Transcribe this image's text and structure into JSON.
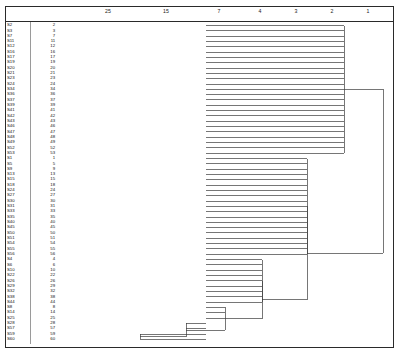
{
  "chart_data": {
    "type": "dendrogram",
    "title": "",
    "subtitle": "",
    "xlabel": "Rescaled Distance Cluster Combine",
    "ylabel": "",
    "grid": false,
    "legend": null,
    "axis": {
      "orientation": "top",
      "direction": "decreasing-left-to-right",
      "tick_labels": [
        "25",
        "15",
        "7",
        "4",
        "3",
        "2",
        "1"
      ],
      "tick_positions_px": [
        108,
        166,
        219,
        260,
        296,
        332,
        368
      ],
      "range": [
        25,
        1
      ]
    },
    "leaf_count": 60,
    "leaf_labels_left": [
      "S2",
      "S3",
      "S7",
      "S11",
      "S12",
      "S16",
      "S17",
      "S19",
      "S20",
      "S21",
      "S23",
      "S24",
      "S34",
      "S36",
      "S37",
      "S39",
      "S41",
      "S42",
      "S43",
      "S46",
      "S47",
      "S48",
      "S49",
      "S52",
      "S53",
      "S1",
      "S5",
      "S9",
      "S13",
      "S15",
      "S18",
      "S24",
      "S27",
      "S30",
      "S31",
      "S33",
      "S35",
      "S40",
      "S45",
      "S50",
      "S51",
      "S54",
      "S55",
      "S56",
      "S4",
      "S6",
      "S10",
      "S22",
      "S26",
      "S29",
      "S32",
      "S38",
      "S44",
      "S8",
      "S14",
      "S25",
      "S28",
      "S57",
      "S59",
      "S60"
    ],
    "leaf_labels_right": [
      "2",
      "3",
      "7",
      "11",
      "12",
      "16",
      "17",
      "19",
      "20",
      "21",
      "23",
      "24",
      "34",
      "36",
      "37",
      "39",
      "41",
      "42",
      "43",
      "46",
      "47",
      "48",
      "49",
      "52",
      "53",
      "1",
      "5",
      "9",
      "13",
      "15",
      "18",
      "24",
      "27",
      "30",
      "31",
      "33",
      "35",
      "40",
      "45",
      "50",
      "51",
      "54",
      "55",
      "56",
      "4",
      "6",
      "10",
      "22",
      "26",
      "29",
      "32",
      "38",
      "44",
      "8",
      "14",
      "25",
      "28",
      "57",
      "59",
      "60"
    ],
    "structure_note": "Four top-level groups: leaves 1-25 join at x=344; leaves 26-44 join at x=307; leaves 45-53 join at x=262; leaves 54-60 form nested small merges then join at x=262. Root merge at x=383.",
    "merges_px": [
      {
        "name": "cluster-a",
        "x": 344,
        "y_top": 26,
        "y_bottom": 155
      },
      {
        "name": "cluster-b",
        "x": 307,
        "y_top": 160,
        "y_bottom": 262
      },
      {
        "name": "cluster-c",
        "x": 262,
        "y_top": 267,
        "y_bottom": 310
      },
      {
        "name": "cluster-d",
        "x": 225,
        "y_top": 300,
        "y_bottom": 331
      },
      {
        "name": "cluster-e",
        "x": 186,
        "y_top": 322,
        "y_bottom": 337
      },
      {
        "name": "cluster-f",
        "x": 140,
        "y_top": 331,
        "y_bottom": 343
      },
      {
        "name": "root",
        "x": 383,
        "y_top": 120,
        "y_bottom": 285
      }
    ]
  }
}
